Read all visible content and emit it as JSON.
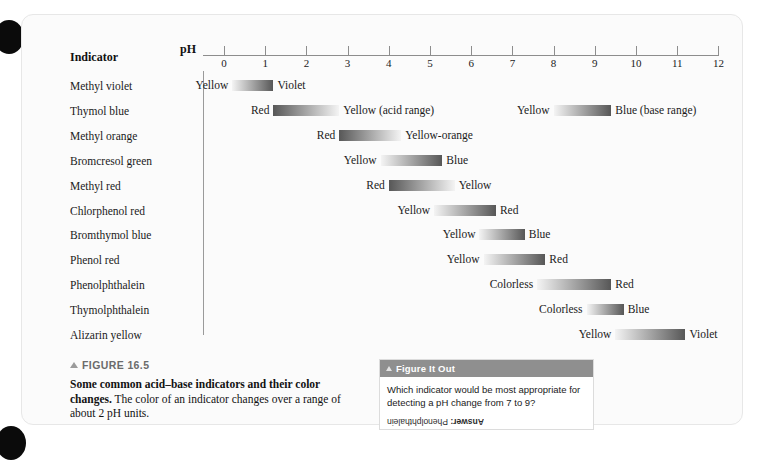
{
  "figure": {
    "number": "FIGURE 16.5",
    "caption_lead": "Some common acid–base indicators and their color changes.",
    "caption_rest": " The color of an indicator changes over a range of about 2 pH units."
  },
  "chart_data": {
    "type": "bar",
    "title": "Some common acid–base indicators and their color changes",
    "xlabel": "pH",
    "ylabel": "Indicator",
    "xlim": [
      0,
      12
    ],
    "xticks": [
      0,
      1,
      2,
      3,
      4,
      5,
      6,
      7,
      8,
      9,
      10,
      11,
      12
    ],
    "grid": false,
    "legend": "none",
    "column_header": "Indicator",
    "axis_label": "pH",
    "categories": [
      "Methyl violet",
      "Thymol blue",
      "Methyl orange",
      "Bromcresol green",
      "Methyl red",
      "Chlorphenol red",
      "Bromthymol blue",
      "Phenol red",
      "Phenolphthalein",
      "Thymolphthalein",
      "Alizarin yellow"
    ],
    "rows": [
      {
        "indicator": "Methyl violet",
        "ranges": [
          {
            "ph_start": 0.2,
            "ph_end": 1.2,
            "acid_color": "Yellow",
            "base_color": "Violet",
            "direction": "light-to-dark",
            "note": ""
          }
        ]
      },
      {
        "indicator": "Thymol blue",
        "ranges": [
          {
            "ph_start": 1.2,
            "ph_end": 2.8,
            "acid_color": "Red",
            "base_color": "Yellow (acid range)",
            "direction": "dark-to-light",
            "note": "acid range"
          },
          {
            "ph_start": 8.0,
            "ph_end": 9.4,
            "acid_color": "Yellow",
            "base_color": "Blue (base range)",
            "direction": "light-to-dark",
            "note": "base range"
          }
        ]
      },
      {
        "indicator": "Methyl orange",
        "ranges": [
          {
            "ph_start": 2.8,
            "ph_end": 4.3,
            "acid_color": "Red",
            "base_color": "Yellow-orange",
            "direction": "dark-to-light",
            "note": ""
          }
        ]
      },
      {
        "indicator": "Bromcresol green",
        "ranges": [
          {
            "ph_start": 3.8,
            "ph_end": 5.3,
            "acid_color": "Yellow",
            "base_color": "Blue",
            "direction": "light-to-dark",
            "note": ""
          }
        ]
      },
      {
        "indicator": "Methyl red",
        "ranges": [
          {
            "ph_start": 4.0,
            "ph_end": 5.6,
            "acid_color": "Red",
            "base_color": "Yellow",
            "direction": "dark-to-light",
            "note": ""
          }
        ]
      },
      {
        "indicator": "Chlorphenol red",
        "ranges": [
          {
            "ph_start": 5.1,
            "ph_end": 6.6,
            "acid_color": "Yellow",
            "base_color": "Red",
            "direction": "light-to-dark",
            "note": ""
          }
        ]
      },
      {
        "indicator": "Bromthymol blue",
        "ranges": [
          {
            "ph_start": 6.2,
            "ph_end": 7.3,
            "acid_color": "Yellow",
            "base_color": "Blue",
            "direction": "light-to-dark",
            "note": ""
          }
        ]
      },
      {
        "indicator": "Phenol red",
        "ranges": [
          {
            "ph_start": 6.3,
            "ph_end": 7.8,
            "acid_color": "Yellow",
            "base_color": "Red",
            "direction": "light-to-dark",
            "note": ""
          }
        ]
      },
      {
        "indicator": "Phenolphthalein",
        "ranges": [
          {
            "ph_start": 7.6,
            "ph_end": 9.4,
            "acid_color": "Colorless",
            "base_color": "Red",
            "direction": "light-to-dark",
            "note": ""
          }
        ]
      },
      {
        "indicator": "Thymolphthalein",
        "ranges": [
          {
            "ph_start": 8.8,
            "ph_end": 9.7,
            "acid_color": "Colorless",
            "base_color": "Blue",
            "direction": "light-to-dark",
            "note": ""
          }
        ]
      },
      {
        "indicator": "Alizarin yellow",
        "ranges": [
          {
            "ph_start": 9.5,
            "ph_end": 11.2,
            "acid_color": "Yellow",
            "base_color": "Violet",
            "direction": "light-to-dark",
            "note": ""
          }
        ]
      }
    ]
  },
  "figure_it_out": {
    "header": "Figure It Out",
    "question": "Which indicator would be most appropriate for detecting a pH change from 7 to 9?",
    "answer_label": "Answer:",
    "answer_text": " Phenolphthalein"
  },
  "colors": {
    "gradient_dark": "#575757",
    "gradient_light": "#f4f4f4",
    "axis": "#8d8d8d",
    "text": "#1a1a1a",
    "fio_header_bg": "#8f8f8f",
    "card_bg": "#fbfbfb"
  }
}
